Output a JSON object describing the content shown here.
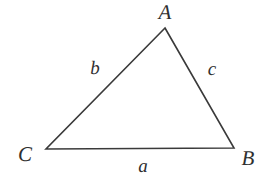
{
  "figure": {
    "kind": "geometry-diagram",
    "shape_name": "triangle",
    "background_color": "#ffffff",
    "stroke_color": "#3a3a3a",
    "label_color": "#2f2f2f",
    "stroke_width": 1.6,
    "canvas": {
      "width": 268,
      "height": 182
    }
  },
  "vertices": [
    {
      "id": "A",
      "label": "A",
      "x": 165,
      "y": 28,
      "label_x": 165,
      "label_y": 12
    },
    {
      "id": "B",
      "label": "B",
      "x": 234,
      "y": 148,
      "label_x": 248,
      "label_y": 158
    },
    {
      "id": "C",
      "label": "C",
      "x": 46,
      "y": 149,
      "label_x": 25,
      "label_y": 154
    }
  ],
  "sides": [
    {
      "id": "a",
      "label": "a",
      "from": "B",
      "to": "C",
      "label_x": 143,
      "label_y": 166
    },
    {
      "id": "b",
      "label": "b",
      "from": "C",
      "to": "A",
      "label_x": 95,
      "label_y": 68
    },
    {
      "id": "c",
      "label": "c",
      "from": "A",
      "to": "B",
      "label_x": 212,
      "label_y": 69
    }
  ],
  "polygon_points": "165,28 234,148 46,149"
}
